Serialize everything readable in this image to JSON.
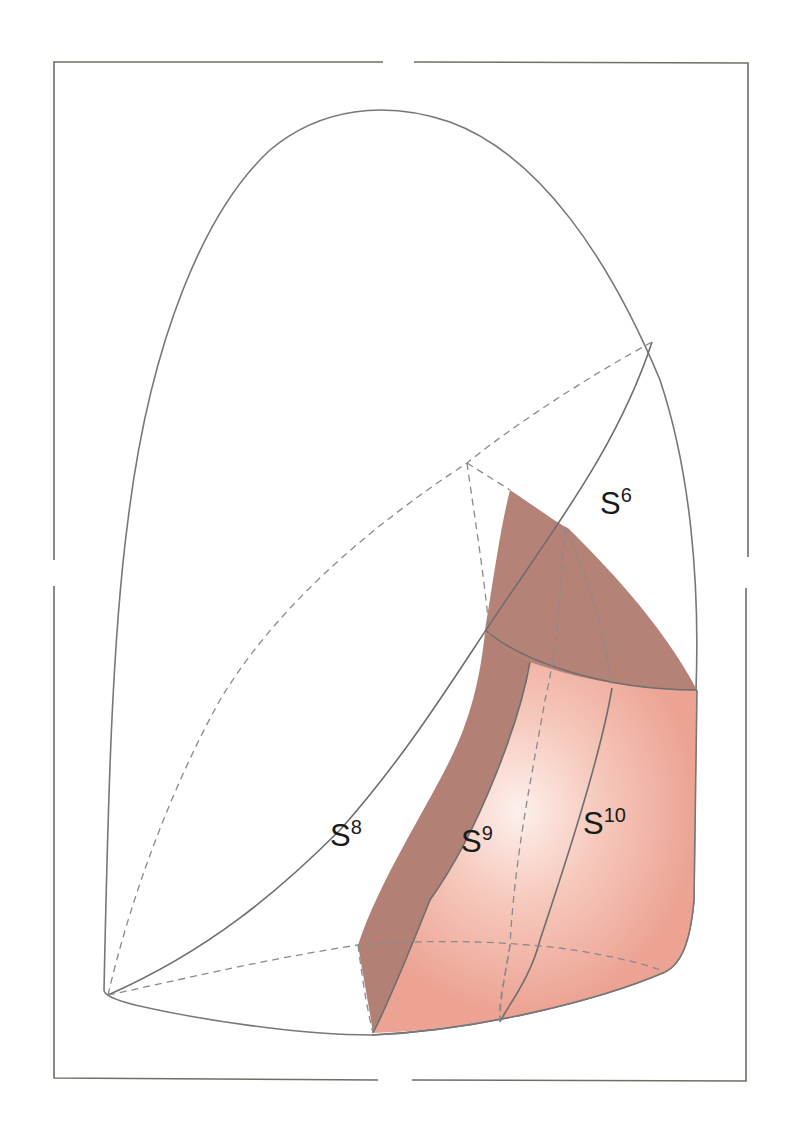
{
  "diagram": {
    "type": "anatomical segment diagram",
    "colors": {
      "lobe_fill": "#ece9f5",
      "lobe_highlight": "#ffffff",
      "shadow_face": "#b58278",
      "segment_face": "#eea898",
      "segment_highlight": "#fbe9e4",
      "outline": "#777777",
      "frame": "#6f6f66"
    },
    "labels": [
      {
        "id": "S6",
        "base": "S",
        "sup": "6",
        "x": 636,
        "y": 500
      },
      {
        "id": "S8",
        "base": "S",
        "sup": "8",
        "x": 333,
        "y": 832
      },
      {
        "id": "S9",
        "base": "S",
        "sup": "9",
        "x": 462,
        "y": 840
      },
      {
        "id": "S10",
        "base": "S",
        "sup": "10",
        "x": 582,
        "y": 815
      }
    ]
  }
}
